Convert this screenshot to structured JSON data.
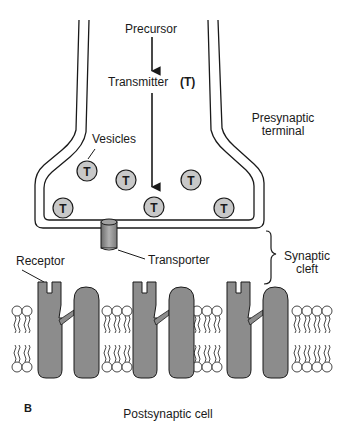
{
  "figure": {
    "panel_label": "B",
    "labels": {
      "precursor": "Precursor",
      "transmitter": "Transmitter",
      "transmitter_symbol": "(T)",
      "vesicles": "Vesicles",
      "presynaptic_line1": "Presynaptic",
      "presynaptic_line2": "terminal",
      "transporter": "Transporter",
      "receptor": "Receptor",
      "synaptic_line1": "Synaptic",
      "synaptic_line2": "cleft",
      "postsynaptic": "Postsynaptic cell"
    },
    "vesicle_symbol": "T",
    "vesicles": [
      {
        "x": 87,
        "y": 171
      },
      {
        "x": 126,
        "y": 180
      },
      {
        "x": 191,
        "y": 180
      },
      {
        "x": 63,
        "y": 208
      },
      {
        "x": 154,
        "y": 207
      },
      {
        "x": 224,
        "y": 208
      }
    ],
    "colors": {
      "line": "#1a1a1a",
      "vesicle_fill": "#c8c8c8",
      "protein_fill": "#8c8c8c",
      "background": "#ffffff"
    }
  }
}
